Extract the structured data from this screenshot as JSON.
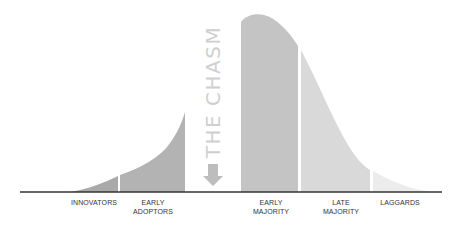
{
  "diagram": {
    "chasm_label": "THE CHASM",
    "chasm_icon": "down-arrow-icon",
    "segments": [
      {
        "id": "innovators",
        "label_line1": "INNOVATORS",
        "label_line2": "",
        "color": "#a9a9a9"
      },
      {
        "id": "early-adopters",
        "label_line1": "EARLY",
        "label_line2": "ADOPTORS",
        "color": "#b3b3b3"
      },
      {
        "id": "early-majority",
        "label_line1": "EARLY",
        "label_line2": "MAJORITY",
        "color": "#c4c4c4"
      },
      {
        "id": "late-majority",
        "label_line1": "LATE",
        "label_line2": "MAJORITY",
        "color": "#d9d9d9"
      },
      {
        "id": "laggards",
        "label_line1": "LAGGARDS",
        "label_line2": "",
        "color": "#ececec"
      }
    ],
    "colors": {
      "baseline": "#333333",
      "chasm_text": "#cfcfcf",
      "chasm_arrow": "#bdbdbd",
      "label_text": "#333333"
    }
  }
}
